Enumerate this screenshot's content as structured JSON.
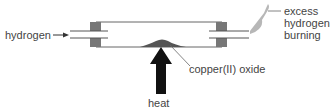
{
  "diagram": {
    "labels": {
      "hydrogen_in": "hydrogen",
      "excess_line1": "excess",
      "excess_line2": "hydrogen",
      "excess_line3": "burning",
      "copper_oxide": "copper(II) oxide",
      "heat": "heat"
    },
    "colors": {
      "line": "#555555",
      "stopper": "#777777",
      "arrow": "#111111",
      "mound": "#555555",
      "flame": "#b0b0b0"
    }
  }
}
